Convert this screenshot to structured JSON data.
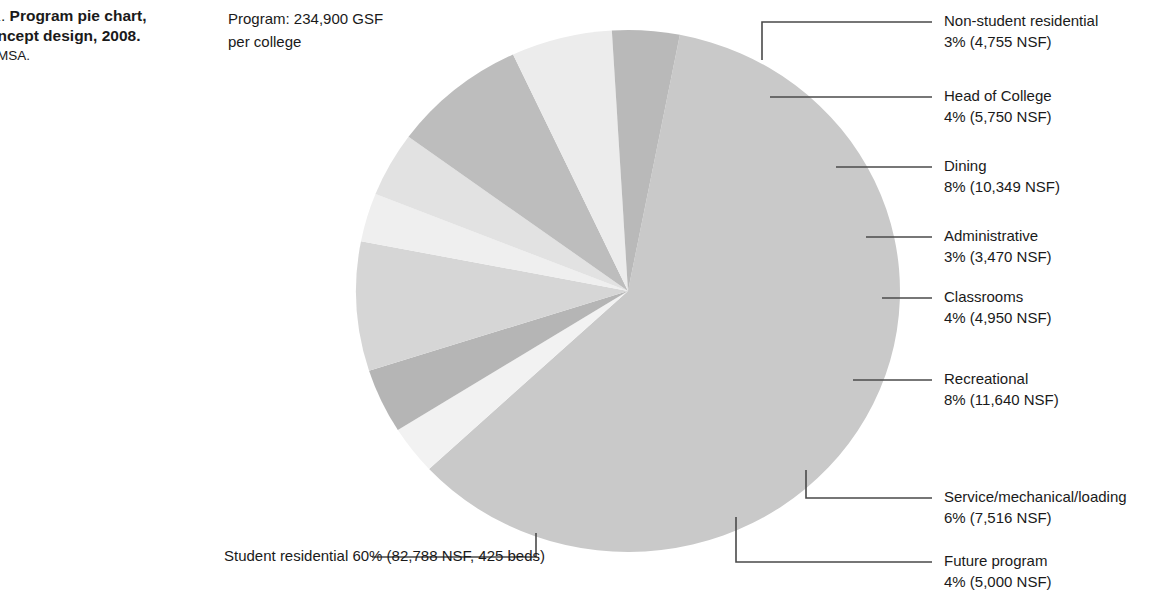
{
  "caption": {
    "line1_prefix": ".1. ",
    "line1_strong": "Program pie chart,",
    "line2_strong": "oncept design, 2008.",
    "credit": "AMSA."
  },
  "program_note": {
    "line1": "Program: 234,900 GSF",
    "line2": "per college"
  },
  "chart_data": {
    "type": "pie",
    "total_label": "Program: 234,900 GSF per college",
    "unit": "NSF",
    "legend_position": "callouts",
    "categories": [
      "Student residential",
      "Non-student residential",
      "Head of College",
      "Dining",
      "Administrative",
      "Classrooms",
      "Recreational",
      "Service/mechanical/loading",
      "Future program"
    ],
    "values": [
      60,
      3,
      4,
      8,
      3,
      4,
      8,
      6,
      4
    ],
    "areas_nsf": [
      82788,
      4755,
      5750,
      10349,
      3470,
      4950,
      11640,
      7516,
      5000
    ],
    "slice_colors": [
      "#c9c9c9",
      "#f2f2f2",
      "#b5b5b5",
      "#d6d6d6",
      "#efefef",
      "#e2e2e2",
      "#bdbdbd",
      "#ececec",
      "#b9b9b9"
    ],
    "slices": [
      {
        "name": "Student residential",
        "percent": 60,
        "area": 82788,
        "pct_label": "60%",
        "value_label": "60% (82,788 NSF, 425 beds)",
        "color": "#c9c9c9",
        "beds": 425
      },
      {
        "name": "Non-student residential",
        "percent": 3,
        "area": 4755,
        "pct_label": "3%",
        "value_label": "3% (4,755 NSF)",
        "color": "#f2f2f2"
      },
      {
        "name": "Head of College",
        "percent": 4,
        "area": 5750,
        "pct_label": "4%",
        "value_label": "4% (5,750 NSF)",
        "color": "#b5b5b5"
      },
      {
        "name": "Dining",
        "percent": 8,
        "area": 10349,
        "pct_label": "8%",
        "value_label": "8% (10,349 NSF)",
        "color": "#d6d6d6"
      },
      {
        "name": "Administrative",
        "percent": 3,
        "area": 3470,
        "pct_label": "3%",
        "value_label": "3% (3,470 NSF)",
        "color": "#efefef"
      },
      {
        "name": "Classrooms",
        "percent": 4,
        "area": 4950,
        "pct_label": "4%",
        "value_label": "4% (4,950 NSF)",
        "color": "#e2e2e2"
      },
      {
        "name": "Recreational",
        "percent": 8,
        "area": 11640,
        "pct_label": "8%",
        "value_label": "8% (11,640 NSF)",
        "color": "#bdbdbd"
      },
      {
        "name": "Service/mechanical/loading",
        "percent": 6,
        "area": 7516,
        "pct_label": "6%",
        "value_label": "6% (7,516 NSF)",
        "color": "#ececec"
      },
      {
        "name": "Future program",
        "percent": 4,
        "area": 5000,
        "pct_label": "4%",
        "value_label": "4% (5,000 NSF)",
        "color": "#b9b9b9"
      }
    ]
  },
  "callouts": {
    "non_student_residential": {
      "name": "Non-student residential",
      "value": "3% (4,755 NSF)"
    },
    "head_of_college": {
      "name": "Head of College",
      "value": "4% (5,750 NSF)"
    },
    "dining": {
      "name": "Dining",
      "value": "8% (10,349 NSF)"
    },
    "administrative": {
      "name": "Administrative",
      "value": "3% (3,470 NSF)"
    },
    "classrooms": {
      "name": "Classrooms",
      "value": "4% (4,950 NSF)"
    },
    "recreational": {
      "name": "Recreational",
      "value": "8% (11,640 NSF)"
    },
    "service": {
      "name": "Service/mechanical/loading",
      "value": "6% (7,516 NSF)"
    },
    "future_program": {
      "name": "Future program",
      "value": "4% (5,000 NSF)"
    },
    "student_residential": {
      "name": "Student residential",
      "value": "60% (82,788 NSF, 425 beds)"
    }
  },
  "colors": {
    "text": "#1a1a1a",
    "leader_line": "#4a4a4a",
    "background": "#ffffff"
  }
}
